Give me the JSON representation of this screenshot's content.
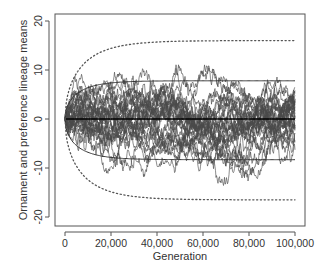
{
  "chart_data": {
    "type": "line",
    "title": "",
    "xlabel": "Generation",
    "ylabel": "Ornament and preference lineage means",
    "xlim": [
      0,
      100000
    ],
    "ylim": [
      -22,
      22
    ],
    "xticks": [
      0,
      20000,
      40000,
      60000,
      80000,
      100000
    ],
    "xtick_labels": [
      "0",
      "20,000",
      "40,000",
      "60,000",
      "80,000",
      "100,000"
    ],
    "yticks": [
      -20,
      -10,
      0,
      10,
      20
    ],
    "ytick_labels": [
      "-20",
      "-10",
      "0",
      "10",
      "20"
    ],
    "grid": false,
    "legend": "none",
    "series": [
      {
        "name": "lineage random walks",
        "kind": "ensemble",
        "count": 30,
        "start": 0,
        "observed_max": 17,
        "observed_min": -19,
        "color": "#4a4a4a"
      },
      {
        "name": "mean",
        "kind": "constant",
        "value": 0,
        "color": "#000000"
      },
      {
        "name": "upper solid envelope",
        "kind": "saturating",
        "asymptote": 7.8,
        "color": "#333333"
      },
      {
        "name": "lower solid envelope",
        "kind": "saturating",
        "asymptote": -8.3,
        "color": "#333333"
      },
      {
        "name": "upper dotted envelope",
        "kind": "saturating",
        "asymptote": 16,
        "style": "dotted",
        "color": "#555555"
      },
      {
        "name": "lower dotted envelope",
        "kind": "saturating",
        "asymptote": -16.5,
        "style": "dotted",
        "color": "#555555"
      }
    ]
  }
}
